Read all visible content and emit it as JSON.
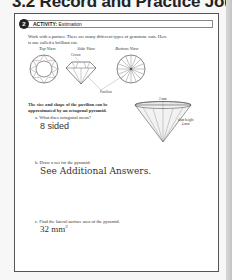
{
  "header": {
    "title": "3.2 Record and Practice Journal"
  },
  "activity": {
    "number": "2",
    "label": "ACTIVITY:",
    "name": "Estimation"
  },
  "intro": {
    "line1": "Work with a partner. There are many different types of gemstone cuts. Here",
    "line2": "is one called a brilliant cut."
  },
  "views": {
    "top": "Top View",
    "side": "Side View",
    "bottom": "Bottom View",
    "crown_label": "Crown",
    "pavilion_label": "Pavilion"
  },
  "pavilion_text": {
    "line1": "The size and shape of the pavilion can be",
    "line2": "approximated by an octagonal pyramid."
  },
  "pyramid_figure": {
    "top_label": "2 mm",
    "slant_label_1": "slant height",
    "slant_label_2": "4 mm"
  },
  "questions": [
    {
      "letter": "a.",
      "prompt": "What does octagonal mean?",
      "answer": "8 sided"
    },
    {
      "letter": "b.",
      "prompt": "Draw a net for the pyramid.",
      "answer": "See Additional Answers."
    },
    {
      "letter": "c.",
      "prompt": "Find the lateral surface area of the pyramid.",
      "answer": "32 mm",
      "answer_sup": "2"
    }
  ]
}
